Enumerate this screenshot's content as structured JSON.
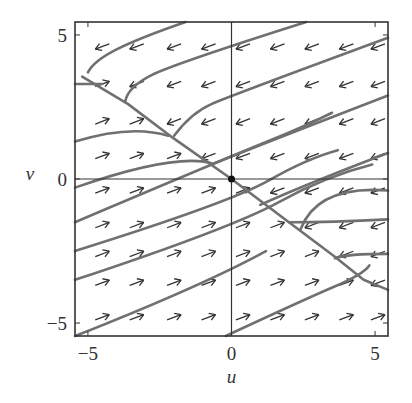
{
  "chart_data": {
    "type": "phase-portrait",
    "title": "",
    "xlabel": "u",
    "ylabel": "v",
    "xlim": [
      -5.45,
      5.45
    ],
    "ylim": [
      -5.45,
      5.45
    ],
    "xticks": [
      -5,
      0,
      5
    ],
    "yticks": [
      -5,
      0,
      5
    ],
    "xtick_labels": [
      "−5",
      "0",
      "5"
    ],
    "ytick_labels": [
      "−5",
      "0",
      "5"
    ],
    "grid": false,
    "zero_lines": true,
    "equilibrium": {
      "u": 0,
      "v": 0,
      "label": "fixed point (origin)"
    },
    "slow_manifold": {
      "description": "diagonal line through origin, approx v = -0.78u",
      "points": [
        [
          -5.2,
          3.55
        ],
        [
          -3.6,
          2.6
        ],
        [
          -2.0,
          1.4
        ],
        [
          0,
          0
        ],
        [
          2.0,
          -1.5
        ],
        [
          3.6,
          -2.7
        ],
        [
          4.6,
          -3.5
        ],
        [
          5.45,
          -3.85
        ]
      ]
    },
    "vector_field": {
      "grid_u": [
        -4.5,
        -3.3,
        -2.0,
        -0.8,
        0.4,
        1.6,
        2.8,
        4.0,
        5.1
      ],
      "grid_v": [
        4.6,
        3.3,
        2.0,
        0.8,
        -0.4,
        -1.6,
        -2.6,
        -3.6,
        -4.8
      ],
      "rule": "arrows point left (with slight downward slope) above the slow manifold, right (with slight upward slope) below it"
    },
    "trajectories": [
      [
        [
          -1.6,
          5.45
        ],
        [
          -3.2,
          4.9
        ],
        [
          -4.8,
          4.1
        ],
        [
          -5.0,
          3.7
        ]
      ],
      [
        [
          2.6,
          5.45
        ],
        [
          -2.0,
          4.0
        ],
        [
          -3.6,
          3.2
        ],
        [
          -3.7,
          2.7
        ]
      ],
      [
        [
          5.45,
          4.9
        ],
        [
          0.0,
          2.9
        ],
        [
          -1.4,
          2.3
        ],
        [
          -2.0,
          1.5
        ]
      ],
      [
        [
          5.45,
          2.9
        ],
        [
          0.0,
          0.8
        ],
        [
          -0.7,
          0.5
        ]
      ],
      [
        [
          5.45,
          0.9
        ],
        [
          2.8,
          -0.1
        ],
        [
          1.0,
          -0.9
        ]
      ],
      [
        [
          -5.45,
          3.3
        ],
        [
          -4.5,
          3.3
        ]
      ],
      [
        [
          -5.45,
          1.3
        ],
        [
          -3.5,
          1.9
        ],
        [
          -2.2,
          1.5
        ]
      ],
      [
        [
          -5.45,
          -0.3
        ],
        [
          -2.0,
          0.9
        ],
        [
          -0.7,
          0.55
        ]
      ],
      [
        [
          -5.45,
          -1.5
        ],
        [
          0.0,
          0.8
        ],
        [
          2.5,
          1.8
        ],
        [
          3.5,
          2.3
        ]
      ],
      [
        [
          -5.45,
          -2.5
        ],
        [
          0.0,
          -0.8
        ],
        [
          2.6,
          0.7
        ],
        [
          3.7,
          1.0
        ]
      ],
      [
        [
          -5.45,
          -3.5
        ],
        [
          0.0,
          -1.7
        ],
        [
          3.3,
          0.1
        ],
        [
          4.9,
          0.5
        ]
      ],
      [
        [
          -5.45,
          -5.45
        ],
        [
          -1.0,
          -3.7
        ],
        [
          1.2,
          -2.5
        ]
      ],
      [
        [
          -0.2,
          -5.45
        ],
        [
          2.5,
          -4.2
        ],
        [
          4.6,
          -3.3
        ],
        [
          4.8,
          -3.0
        ]
      ],
      [
        [
          5.45,
          -2.6
        ],
        [
          4.0,
          -2.6
        ],
        [
          3.6,
          -2.75
        ]
      ],
      [
        [
          5.45,
          -1.4
        ],
        [
          3.5,
          -1.5
        ],
        [
          2.0,
          -1.5
        ]
      ],
      [
        [
          5.45,
          -0.4
        ],
        [
          3.0,
          -0.2
        ],
        [
          2.4,
          -1.75
        ]
      ]
    ]
  },
  "colors": {
    "curve": "#707070",
    "arrow": "#333333",
    "axes": "#333333",
    "background": "#ffffff"
  }
}
